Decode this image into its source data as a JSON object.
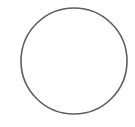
{
  "diagram": {
    "shape": "circle",
    "background_color": "#ffffff",
    "stroke_color": "#5e5e5e",
    "fill_color": "#ffffff",
    "stroke_width": 1.6,
    "center": {
      "x": 74,
      "y": 61
    },
    "radius": 53
  }
}
